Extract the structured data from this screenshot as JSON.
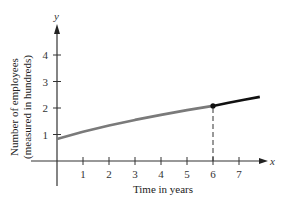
{
  "chart_data": {
    "type": "line",
    "title": "",
    "xlabel": "Time in years",
    "ylabel": "Number of employees",
    "ylabel_sub": "(measured in hundreds)",
    "x_axis_name": "x",
    "y_axis_name": "y",
    "xlim": [
      -1,
      8.3
    ],
    "ylim": [
      -0.95,
      5.0
    ],
    "x_ticks": [
      1,
      2,
      3,
      4,
      5,
      6,
      7
    ],
    "x_tick_labels": [
      "1",
      "2",
      "3",
      "4",
      "5",
      "6",
      "7"
    ],
    "y_ticks": [
      1,
      2,
      3,
      4
    ],
    "y_tick_labels": [
      "1",
      "2",
      "3",
      "4"
    ],
    "grid": false,
    "series": [
      {
        "name": "observed",
        "color": "#7a7a7a",
        "x": [
          0,
          1,
          2,
          3,
          4,
          5,
          6
        ],
        "y": [
          0.83,
          1.1,
          1.34,
          1.55,
          1.74,
          1.92,
          2.08
        ]
      },
      {
        "name": "projected",
        "color": "#111111",
        "x": [
          6,
          6.6,
          7.2,
          7.8
        ],
        "y": [
          2.08,
          2.2,
          2.31,
          2.42
        ]
      }
    ],
    "annotations": [
      {
        "type": "point",
        "x": 6,
        "y": 2.08
      },
      {
        "type": "dashed-vertical",
        "x": 6,
        "from_y": 0,
        "to_y": 2.08
      }
    ]
  }
}
